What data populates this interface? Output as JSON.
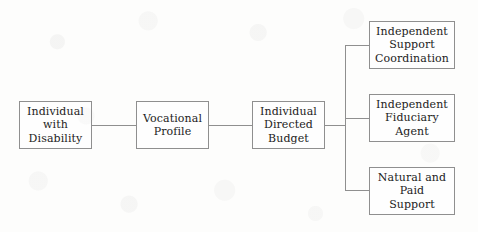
{
  "diagram": {
    "type": "flowchart",
    "background_color": "#fdfdfc",
    "line_color": "#8f8f8f",
    "text_color": "#1c1c1c",
    "nodes": [
      {
        "id": "individual-with-disability",
        "label": "Individual\nwith\nDisability",
        "x": 19,
        "y": 101,
        "w": 73,
        "h": 48
      },
      {
        "id": "vocational-profile",
        "label": "Vocational\nProfile",
        "x": 136,
        "y": 101,
        "w": 73,
        "h": 48
      },
      {
        "id": "individual-directed-budget",
        "label": "Individual\nDirected\nBudget",
        "x": 252,
        "y": 101,
        "w": 73,
        "h": 48
      },
      {
        "id": "independent-support-coordination",
        "label": "Independent\nSupport\nCoordination",
        "x": 369,
        "y": 21,
        "w": 86,
        "h": 48
      },
      {
        "id": "independent-fiduciary-agent",
        "label": "Independent\nFiduciary\nAgent",
        "x": 369,
        "y": 94,
        "w": 86,
        "h": 48
      },
      {
        "id": "natural-and-paid-support",
        "label": "Natural and\nPaid\nSupport",
        "x": 369,
        "y": 167,
        "w": 86,
        "h": 48
      }
    ],
    "connectors": [
      {
        "id": "individual-to-vocational",
        "from": "individual-with-disability",
        "to": "vocational-profile"
      },
      {
        "id": "vocational-to-budget",
        "from": "vocational-profile",
        "to": "individual-directed-budget"
      },
      {
        "id": "budget-to-trunk",
        "from": "individual-directed-budget",
        "to": "branch-trunk"
      },
      {
        "id": "trunk-to-support-coordination",
        "from": "branch-trunk",
        "to": "independent-support-coordination"
      },
      {
        "id": "trunk-to-fiduciary-agent",
        "from": "branch-trunk",
        "to": "independent-fiduciary-agent"
      },
      {
        "id": "trunk-to-natural-paid-support",
        "from": "branch-trunk",
        "to": "natural-and-paid-support"
      }
    ]
  }
}
